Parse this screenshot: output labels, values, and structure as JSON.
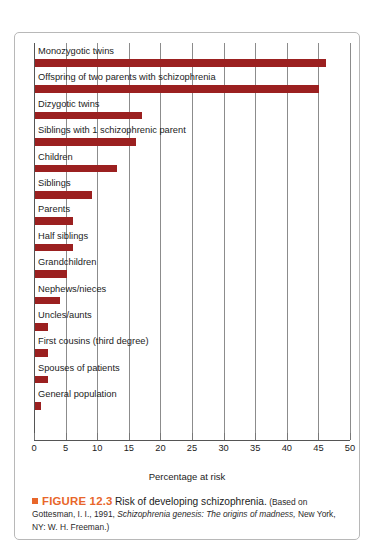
{
  "chart_data": {
    "type": "bar",
    "orientation": "horizontal",
    "title": "Risk of developing schizophrenia",
    "xlabel": "Percentage at risk",
    "ylabel": "",
    "xlim": [
      0,
      50
    ],
    "xticks": [
      0,
      5,
      10,
      15,
      20,
      25,
      30,
      35,
      40,
      45,
      50
    ],
    "grid": true,
    "legend": false,
    "bar_color": "#9b2020",
    "categories": [
      "Monozygotic twins",
      "Offspring of two parents with schizophrenia",
      "Dizygotic twins",
      "Siblings with 1 schizophrenic parent",
      "Children",
      "Siblings",
      "Parents",
      "Half siblings",
      "Grandchildren",
      "Nephews/nieces",
      "Uncles/aunts",
      "First cousins (third degree)",
      "Spouses of patients",
      "General population"
    ],
    "values": [
      46,
      45,
      17,
      16,
      13,
      9,
      6,
      6,
      5,
      4,
      2,
      2,
      2,
      1
    ]
  },
  "caption": {
    "figure_number": "FIGURE 12.3",
    "title": "Risk of developing schizophrenia.",
    "source_line_1": "(Based",
    "source_line_2_pre": "on Gottesman, I. I., 1991, ",
    "source_line_2_italic": "Schizophrenia genesis: The origins of madness,",
    "source_line_3": "New York, NY: W. H. Freeman.)"
  },
  "colors": {
    "bar": "#9b2020",
    "accent": "#e8662a",
    "border": "#b8b8b8",
    "grid": "#8c8c8c"
  }
}
